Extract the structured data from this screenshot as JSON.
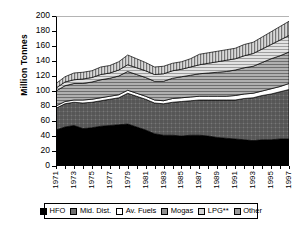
{
  "chart_data": {
    "type": "area",
    "stacked": true,
    "title": "",
    "xlabel": "",
    "ylabel": "Million Tonnes",
    "ylim": [
      0,
      200
    ],
    "ytick_step": 20,
    "ytick_labels": [
      "200",
      "180",
      "160",
      "140",
      "120",
      "100",
      "80",
      "60",
      "40",
      "20",
      "0"
    ],
    "grid": false,
    "legend_position": "bottom",
    "x": [
      1971,
      1972,
      1973,
      1974,
      1975,
      1976,
      1977,
      1978,
      1979,
      1980,
      1981,
      1982,
      1983,
      1984,
      1985,
      1986,
      1987,
      1988,
      1989,
      1990,
      1991,
      1992,
      1993,
      1994,
      1995,
      1996,
      1997
    ],
    "xtick_labels": [
      "1971",
      "1973",
      "1975",
      "1977",
      "1979",
      "1981",
      "1983",
      "1985",
      "1987",
      "1989",
      "1991",
      "1993",
      "1995",
      "1997"
    ],
    "series": [
      {
        "name": "HFO",
        "color": "#000000",
        "pattern": "solid-black",
        "values": [
          48,
          52,
          54,
          50,
          51,
          53,
          54,
          55,
          56,
          52,
          48,
          43,
          41,
          41,
          40,
          41,
          41,
          40,
          38,
          37,
          36,
          35,
          34,
          35,
          35,
          36,
          36
        ]
      },
      {
        "name": "Mid. Dist.",
        "color": "#6e6e6e",
        "pattern": "crosshatch",
        "values": [
          29,
          31,
          31,
          34,
          34,
          34,
          35,
          36,
          41,
          41,
          41,
          41,
          42,
          44,
          46,
          46,
          47,
          48,
          50,
          51,
          52,
          55,
          57,
          59,
          61,
          63,
          66
        ]
      },
      {
        "name": "Av. Fuels",
        "color": "#ffffff",
        "pattern": "solid-white",
        "values": [
          3,
          3,
          3,
          4,
          4,
          4,
          4,
          4,
          4,
          4,
          4,
          4,
          4,
          5,
          5,
          5,
          5,
          5,
          5,
          5,
          6,
          6,
          6,
          6,
          7,
          7,
          8
        ]
      },
      {
        "name": "Mogas",
        "color": "#8f8f8f",
        "pattern": "horizontal-lines",
        "values": [
          20,
          21,
          22,
          22,
          23,
          24,
          24,
          25,
          25,
          25,
          25,
          25,
          26,
          27,
          28,
          29,
          30,
          31,
          32,
          33,
          34,
          35,
          36,
          38,
          40,
          41,
          42
        ]
      },
      {
        "name": "LPG**",
        "color": "#d2d2d2",
        "pattern": "light-horizontal-lines",
        "values": [
          4,
          5,
          5,
          6,
          6,
          7,
          7,
          8,
          9,
          9,
          9,
          9,
          10,
          10,
          10,
          11,
          12,
          13,
          14,
          15,
          15,
          16,
          17,
          18,
          19,
          21,
          22
        ]
      },
      {
        "name": "Other",
        "color": "#9a9a9a",
        "pattern": "vertical-lines",
        "values": [
          6,
          7,
          9,
          9,
          9,
          10,
          10,
          11,
          13,
          12,
          11,
          10,
          10,
          10,
          10,
          11,
          14,
          14,
          14,
          14,
          14,
          15,
          15,
          16,
          17,
          18,
          19
        ]
      }
    ]
  }
}
